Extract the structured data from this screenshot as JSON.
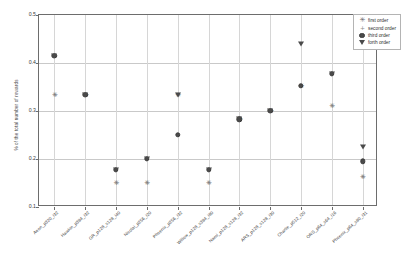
{
  "chart_data": {
    "type": "scatter",
    "title": "",
    "xlabel": "",
    "ylabel": "% of the total number of rewards",
    "ylim": [
      0.1,
      0.5
    ],
    "yticks": [
      "0.1",
      "0.2",
      "0.3",
      "0.4",
      "0.5"
    ],
    "ytick_values": [
      0.1,
      0.2,
      0.3,
      0.4,
      0.5
    ],
    "grid": true,
    "legend_position": "upper right",
    "categories": [
      "Aeon_p320_i32",
      "Hawkin_p384_i32",
      "GR_p128_s128_i40",
      "Nicolai_p256_i20",
      "Phoenix_p256_i32",
      "Willow_p128_s384_i80",
      "Nami_p128_s128_i32",
      "ARS_p128_s128_i30",
      "Charlie_p512_i20",
      "ORS_p64_s64_i16",
      "Phoenix_p64_s80_i31"
    ],
    "series": [
      {
        "name": "first order",
        "marker": "star-icon",
        "values": [
          0.333,
          0.333,
          0.15,
          0.15,
          0.333,
          0.15,
          0.283,
          0.301,
          0.352,
          0.311,
          0.162
        ]
      },
      {
        "name": "second order",
        "marker": "plus-icon",
        "values": [
          0.333,
          0.333,
          0.15,
          0.15,
          0.333,
          0.15,
          0.283,
          0.301,
          0.352,
          0.311,
          0.162
        ]
      },
      {
        "name": "third order",
        "marker": "circle-dot-icon",
        "values": [
          0.415,
          0.334,
          0.177,
          0.2,
          0.25,
          0.177,
          0.283,
          0.301,
          0.352,
          0.378,
          0.195
        ]
      },
      {
        "name": "forth order",
        "marker": "triangle-down-icon",
        "values": [
          0.415,
          0.334,
          0.177,
          0.2,
          0.333,
          0.177,
          0.283,
          0.301,
          0.44,
          0.378,
          0.226
        ]
      }
    ],
    "legend": [
      {
        "label": "first order",
        "marker": "star-icon"
      },
      {
        "label": "second order",
        "marker": "plus-icon"
      },
      {
        "label": "third order",
        "marker": "circle-dot-icon"
      },
      {
        "label": "forth order",
        "marker": "triangle-down-icon"
      }
    ],
    "colors": {
      "marker": "#4a4a4a",
      "light_marker": "#8d8d8d",
      "grid": "#c9c9c9",
      "axis": "#6d6d6d",
      "background": "#ffffff"
    }
  }
}
